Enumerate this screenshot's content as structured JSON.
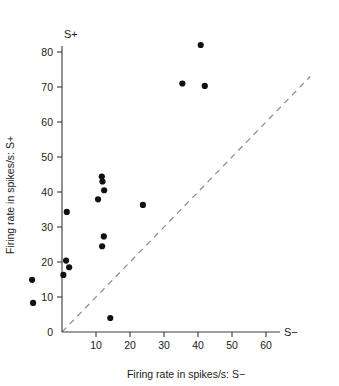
{
  "figure": {
    "background": "#ffffff",
    "point_color": "#111111",
    "axis_color": "#3a3a3a",
    "unity_line_color": "#8a8a8a"
  },
  "labels": {
    "top_corner": "S+",
    "right_corner": "S−"
  },
  "chart_data": {
    "type": "scatter",
    "title": "",
    "xlabel": "Firing rate in spikes/s: S−",
    "ylabel": "Firing rate in spikes/s: S+",
    "xlim": [
      -11,
      68
    ],
    "ylim": [
      0,
      86
    ],
    "xticks": [
      0,
      10,
      20,
      30,
      40,
      50,
      60
    ],
    "xticklabels": [
      "0",
      "10",
      "20",
      "30",
      "40",
      "50",
      "60"
    ],
    "yticks": [
      0,
      10,
      20,
      30,
      40,
      50,
      60,
      70,
      80
    ],
    "yticklabels": [
      "0",
      "10",
      "20",
      "30",
      "40",
      "50",
      "60",
      "70",
      "80"
    ],
    "grid": false,
    "legend": null,
    "annotations": [
      {
        "text": "S+",
        "position": "top-of-y-axis"
      },
      {
        "text": "S−",
        "position": "right-of-x-axis"
      }
    ],
    "reference_line": {
      "type": "unity",
      "style": "dashed",
      "x": [
        0,
        73
      ],
      "y": [
        0,
        73
      ],
      "description": "diagonal y = x equality line"
    },
    "points": [
      {
        "x": 40.8,
        "y": 82.0
      },
      {
        "x": 35.4,
        "y": 71.0
      },
      {
        "x": 42.0,
        "y": 70.3
      },
      {
        "x": 11.7,
        "y": 44.4
      },
      {
        "x": 11.9,
        "y": 43.0
      },
      {
        "x": 12.4,
        "y": 40.5
      },
      {
        "x": 10.6,
        "y": 37.9
      },
      {
        "x": 23.8,
        "y": 36.3
      },
      {
        "x": 1.4,
        "y": 34.3
      },
      {
        "x": 12.3,
        "y": 27.3
      },
      {
        "x": 11.8,
        "y": 24.5
      },
      {
        "x": 1.2,
        "y": 20.4
      },
      {
        "x": 2.1,
        "y": 18.5
      },
      {
        "x": 0.4,
        "y": 16.3
      },
      {
        "x": -8.8,
        "y": 14.9
      },
      {
        "x": -8.5,
        "y": 8.3
      },
      {
        "x": 14.2,
        "y": 4.0
      }
    ],
    "series": [
      {
        "name": "neurons",
        "x": [
          40.8,
          35.4,
          42.0,
          11.7,
          11.9,
          12.4,
          10.6,
          23.8,
          1.4,
          12.3,
          11.8,
          1.2,
          2.1,
          0.4,
          -8.8,
          -8.5,
          14.2
        ],
        "y": [
          82.0,
          71.0,
          70.3,
          44.4,
          43.0,
          40.5,
          37.9,
          36.3,
          34.3,
          27.3,
          24.5,
          20.4,
          18.5,
          16.3,
          14.9,
          8.3,
          4.0
        ]
      }
    ]
  }
}
